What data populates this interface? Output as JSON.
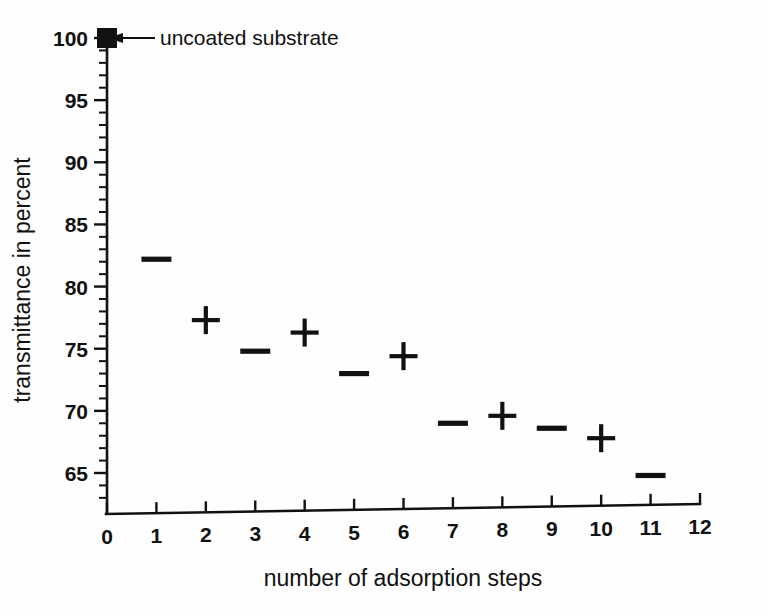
{
  "chart_data": {
    "type": "scatter",
    "title": "",
    "xlabel": "number of adsorption steps",
    "ylabel": "transmittance in percent",
    "xlim": [
      0,
      12
    ],
    "ylim": [
      62.9,
      100.6
    ],
    "grid": false,
    "legend": "none",
    "x_ticks": [
      "0",
      "1",
      "2",
      "3",
      "4",
      "5",
      "6",
      "7",
      "8",
      "9",
      "10",
      "11",
      "12"
    ],
    "x_tick_values": [
      0,
      1,
      2,
      3,
      4,
      5,
      6,
      7,
      8,
      9,
      10,
      11,
      12
    ],
    "y_ticks": [
      "65",
      "70",
      "75",
      "80",
      "85",
      "90",
      "95",
      "100"
    ],
    "y_tick_values": [
      65,
      70,
      75,
      80,
      85,
      90,
      95,
      100
    ],
    "y_minor_step": 1,
    "series": [
      {
        "name": "uncoated substrate",
        "marker": "filled-square",
        "x": [
          0
        ],
        "values": [
          100.0
        ]
      },
      {
        "name": "odd adsorption steps",
        "marker": "dash",
        "x": [
          1,
          3,
          5,
          7,
          9,
          11
        ],
        "values": [
          82.2,
          74.8,
          73.0,
          69.0,
          68.6,
          64.8
        ]
      },
      {
        "name": "even adsorption steps",
        "marker": "plus",
        "x": [
          2,
          4,
          6,
          8,
          10
        ],
        "values": [
          77.3,
          76.3,
          74.4,
          69.6,
          67.8
        ]
      }
    ],
    "annotations": [
      {
        "text": "uncoated substrate",
        "points_to_x": 0,
        "points_to_y": 100.0
      }
    ]
  },
  "axis": {
    "x_title": "number of adsorption steps",
    "y_title": "transmittance in percent"
  },
  "annotation": {
    "uncoated_label": "uncoated substrate"
  },
  "colors": {
    "ink": "#111111",
    "background": "#fefefe"
  }
}
